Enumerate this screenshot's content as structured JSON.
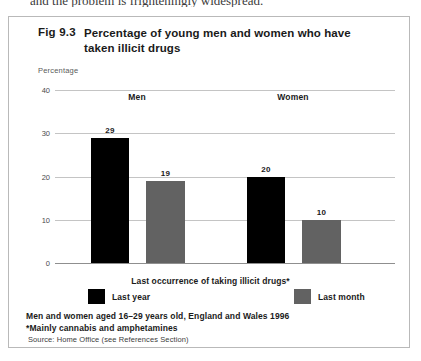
{
  "page_top_text": "and the problem is frighteningly widespread.",
  "figure": {
    "number": "Fig 9.3",
    "title": "Percentage of young men and women who have taken illicit drugs"
  },
  "footnotes": [
    "Men and women aged 16–29 years old, England and Wales 1996",
    "*Mainly cannabis and amphetamines"
  ],
  "source": "Source: Home Office (see References Section)",
  "colors": {
    "last_year": "#000000",
    "last_month": "#626262",
    "gridline": "#c4c4c4",
    "frame": "#b9b9b9"
  },
  "chart_data": {
    "type": "bar",
    "title": "Percentage of young men and women who have taken illicit drugs",
    "xlabel": "Last occurrence of taking illicit drugs*",
    "ylabel": "Percentage",
    "ylim": [
      0,
      40
    ],
    "yticks": [
      0,
      10,
      20,
      30,
      40
    ],
    "ytick_labels": [
      "0",
      "10",
      "20",
      "30",
      "40"
    ],
    "grid": true,
    "legend_position": "bottom",
    "categories": [
      "Men",
      "Women"
    ],
    "series": [
      {
        "name": "Last year",
        "color": "#000000",
        "values": [
          29,
          20
        ]
      },
      {
        "name": "Last month",
        "color": "#626262",
        "values": [
          19,
          10
        ]
      }
    ],
    "bars": [
      {
        "group": "Men",
        "series": "Last year",
        "value": 29,
        "label": "29"
      },
      {
        "group": "Men",
        "series": "Last month",
        "value": 19,
        "label": "19"
      },
      {
        "group": "Women",
        "series": "Last year",
        "value": 20,
        "label": "20"
      },
      {
        "group": "Women",
        "series": "Last month",
        "value": 10,
        "label": "10"
      }
    ]
  }
}
